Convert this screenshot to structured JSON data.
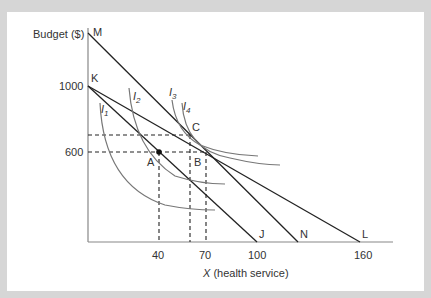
{
  "figure": {
    "y_axis_label": "Budget ($)",
    "x_axis_label_var": "X",
    "x_axis_label_rest": " (health service)",
    "y_ticks": [
      "1000",
      "600"
    ],
    "x_ticks": [
      "40",
      "70",
      "100",
      "160"
    ],
    "line_labels": {
      "M": "M",
      "K": "K",
      "J": "J",
      "N": "N",
      "L": "L"
    },
    "point_labels": {
      "A": "A",
      "B": "B",
      "C": "C"
    },
    "indifference_curves": [
      {
        "name": "I",
        "sub": "1"
      },
      {
        "name": "I",
        "sub": "2"
      },
      {
        "name": "I",
        "sub": "3"
      },
      {
        "name": "I",
        "sub": "4"
      }
    ],
    "colors": {
      "background": "#d6d6d6",
      "panel": "#ffffff",
      "budget_lines": "#222222",
      "curves": "#777777",
      "axes": "#888888"
    }
  }
}
